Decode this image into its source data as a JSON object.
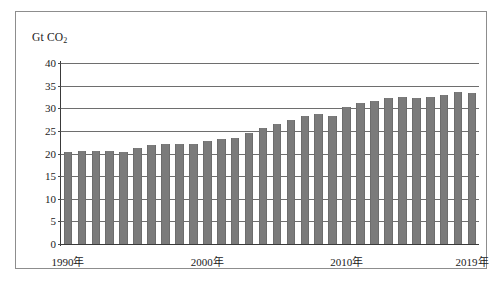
{
  "figure": {
    "unit_label_prefix": "Gt CO",
    "unit_label_sub": "2"
  },
  "chart_data": {
    "type": "bar",
    "title": "",
    "subtitle": "",
    "xlabel": "",
    "ylabel": "Gt CO2",
    "unit": "Gt CO2",
    "ylim": [
      0,
      40
    ],
    "ytick_labels": [
      "0",
      "5",
      "10",
      "15",
      "20",
      "25",
      "30",
      "35",
      "40"
    ],
    "yticks": [
      0,
      5,
      10,
      15,
      20,
      25,
      30,
      35,
      40
    ],
    "grid": "horizontal",
    "legend": "none",
    "bar_color": "#7b7b7b",
    "categories": [
      "1990",
      "1991",
      "1992",
      "1993",
      "1994",
      "1995",
      "1996",
      "1997",
      "1998",
      "1999",
      "2000",
      "2001",
      "2002",
      "2003",
      "2004",
      "2005",
      "2006",
      "2007",
      "2008",
      "2009",
      "2010",
      "2011",
      "2012",
      "2013",
      "2014",
      "2015",
      "2016",
      "2017",
      "2018",
      "2019"
    ],
    "xtick_labels": [
      "1990年",
      "2000年",
      "2010年",
      "2019年"
    ],
    "xtick_categories": [
      "1990",
      "2000",
      "2010",
      "2019"
    ],
    "values": [
      20.4,
      20.6,
      20.5,
      20.5,
      20.4,
      21.2,
      21.8,
      22.1,
      22.0,
      22.2,
      22.8,
      23.1,
      23.4,
      24.5,
      25.6,
      26.6,
      27.5,
      28.3,
      28.7,
      28.2,
      30.3,
      31.2,
      31.6,
      32.3,
      32.4,
      32.3,
      32.4,
      32.9,
      33.6,
      33.3
    ]
  }
}
